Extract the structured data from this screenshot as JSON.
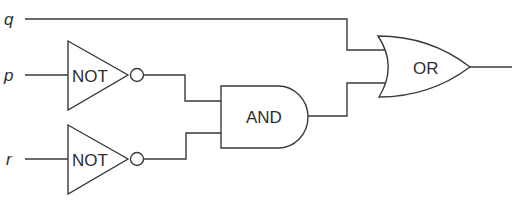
{
  "diagram": {
    "type": "logic-circuit",
    "inputs": [
      {
        "id": "q",
        "label": "q"
      },
      {
        "id": "p",
        "label": "p"
      },
      {
        "id": "r",
        "label": "r"
      }
    ],
    "gates": [
      {
        "id": "not1",
        "type": "NOT",
        "label": "NOT",
        "input": "p"
      },
      {
        "id": "not2",
        "type": "NOT",
        "label": "NOT",
        "input": "r"
      },
      {
        "id": "and1",
        "type": "AND",
        "label": "AND",
        "inputs": [
          "not1",
          "not2"
        ]
      },
      {
        "id": "or1",
        "type": "OR",
        "label": "OR",
        "inputs": [
          "q",
          "and1"
        ]
      }
    ],
    "output": "or1",
    "colors": {
      "stroke": "#3a3a3a",
      "text": "#2e2e2e",
      "background": "#ffffff"
    }
  }
}
